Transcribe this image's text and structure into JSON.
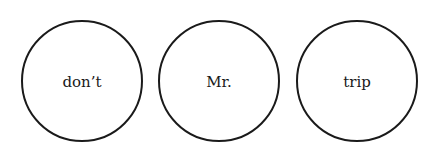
{
  "circles": [
    {
      "label": "don’t"
    },
    {
      "label": "Mr."
    },
    {
      "label": "trip"
    }
  ],
  "colors": {
    "stroke": "#1a1a1a",
    "background": "#ffffff"
  }
}
